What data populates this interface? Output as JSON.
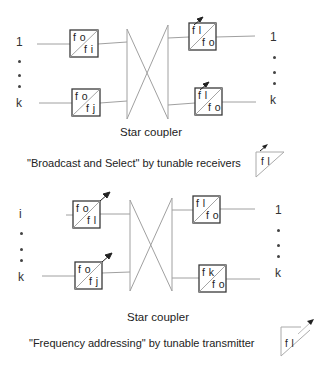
{
  "top_section": {
    "inputs": {
      "first": "1",
      "last": "k"
    },
    "outputs": {
      "first": "1",
      "last": "k"
    },
    "transmitters": [
      {
        "top": "f o",
        "bottom": "f i",
        "tunable": false
      },
      {
        "top": "f o",
        "bottom": "f j",
        "tunable": false
      }
    ],
    "receivers": [
      {
        "top": "f l",
        "bottom": "f o",
        "tunable": true
      },
      {
        "top": "f l",
        "bottom": "f o",
        "tunable": true
      }
    ],
    "coupler_label": "Star coupler",
    "caption": "\"Broadcast and Select\" by tunable receivers",
    "legend_icon": {
      "label": "f l",
      "type": "tunable-receiver-filter"
    }
  },
  "bottom_section": {
    "inputs": {
      "first": "i",
      "last": "k"
    },
    "outputs": {
      "first": "1",
      "last": "k"
    },
    "transmitters": [
      {
        "top": "f o",
        "bottom": "f l",
        "tunable": true
      },
      {
        "top": "f o",
        "bottom": "f j",
        "tunable": true
      }
    ],
    "receivers": [
      {
        "top": "f l",
        "bottom": "f o",
        "tunable": false
      },
      {
        "top": "f k",
        "bottom": "f o",
        "tunable": false
      }
    ],
    "coupler_label": "Star coupler",
    "caption": "\"Frequency addressing\" by tunable transmitter",
    "legend_icon": {
      "label": "f l",
      "type": "tunable-transmitter-filter"
    }
  },
  "colors": {
    "line": "#9a9a9a",
    "box": "#3a3a3a",
    "text": "#222222"
  }
}
